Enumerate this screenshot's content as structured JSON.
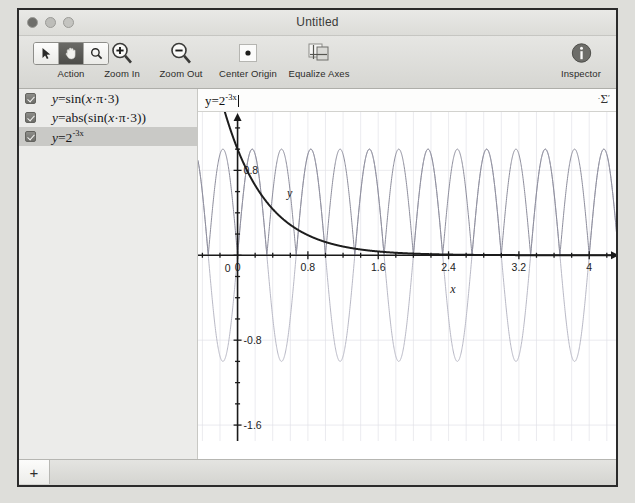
{
  "window": {
    "title": "Untitled",
    "traffic_lights": [
      "close-button",
      "minimize-button",
      "zoom-button"
    ]
  },
  "toolbar": {
    "action": {
      "label": "Action",
      "buttons": [
        {
          "icon": "arrow-pointer-icon",
          "selected": false
        },
        {
          "icon": "hand-pan-icon",
          "selected": true
        },
        {
          "icon": "magnifier-icon",
          "selected": false
        }
      ]
    },
    "zoom_in": {
      "label": "Zoom In",
      "icon": "magnifier-plus-icon"
    },
    "zoom_out": {
      "label": "Zoom Out",
      "icon": "magnifier-minus-icon"
    },
    "center_origin": {
      "label": "Center Origin",
      "icon": "center-origin-icon"
    },
    "equalize_axes": {
      "label": "Equalize Axes",
      "icon": "equalize-axes-icon"
    },
    "inspector": {
      "label": "Inspector",
      "icon": "info-circle-icon"
    }
  },
  "sidebar": {
    "equations": [
      {
        "checked": true,
        "selected": false,
        "text": "y=sin(x·π·3)"
      },
      {
        "checked": true,
        "selected": false,
        "text": "y=abs(sin(x·π·3))"
      },
      {
        "checked": true,
        "selected": true,
        "text": "y=2",
        "exponent": "-3x"
      }
    ],
    "add_button": "+"
  },
  "formula_bar": {
    "base": "y=2",
    "exponent": "-3x",
    "caret_visible": true,
    "sigma_menu": "Σ"
  },
  "chart_data": {
    "type": "line",
    "title": "",
    "xlabel": "x",
    "ylabel": "y",
    "xlim": [
      -0.45,
      4.35
    ],
    "ylim": [
      -1.75,
      1.35
    ],
    "xticks": [
      0,
      0.8,
      1.6,
      2.4,
      3.2,
      4
    ],
    "xticklabels": [
      "0",
      "0.8",
      "1.6",
      "2.4",
      "3.2",
      "4"
    ],
    "yticks": [
      0.8,
      0,
      -0.8,
      -1.6
    ],
    "yticklabels": [
      "0.8",
      "0",
      "-0.8",
      "-1.6"
    ],
    "minor_tick_step_x": 0.2,
    "minor_tick_step_y": 0.2,
    "grid": true,
    "grid_color": "#e2e2e8",
    "legend": "none",
    "series": [
      {
        "name": "y=sin(x·π·3)",
        "expression": "sin(3*PI*x)",
        "color": "#b9b9c6",
        "width": 1,
        "amplitude": 1,
        "period": 0.6667
      },
      {
        "name": "y=abs(sin(x·π·3))",
        "expression": "abs(sin(3*PI*x))",
        "color": "#8d8d9c",
        "width": 1,
        "amplitude": 1,
        "period": 0.3333
      },
      {
        "name": "y=2^(-3x)",
        "expression": "2^(-3*x)",
        "color": "#1d1d1d",
        "width": 2,
        "y_at_0": 1,
        "decay_base": 2,
        "decay_rate": 3
      }
    ]
  }
}
